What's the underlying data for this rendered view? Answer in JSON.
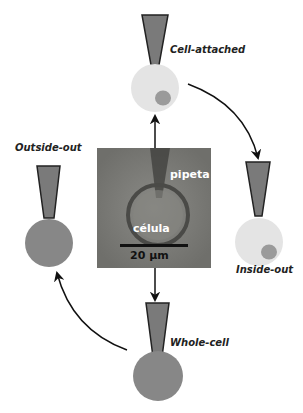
{
  "diagram": {
    "center_image": {
      "pipette_label": "pipeta",
      "cell_label": "célula",
      "scale_bar_label": "20 µm"
    },
    "configurations": [
      {
        "id": "cell-attached",
        "label": "Cell-attached",
        "cell_color": "#e4e4e4",
        "has_nucleus": true
      },
      {
        "id": "inside-out",
        "label": "Inside-out",
        "cell_color": "#e4e4e4",
        "has_nucleus": true
      },
      {
        "id": "whole-cell",
        "label": "Whole-cell",
        "cell_color": "#878787",
        "has_nucleus": false
      },
      {
        "id": "outside-out",
        "label": "Outside-out",
        "cell_color": "#878787",
        "has_nucleus": false
      }
    ],
    "colors": {
      "pipette_fill": "#7a7a7a",
      "pipette_edge": "#222222",
      "light_cell": "#e4e4e4",
      "nucleus": "#9a9a9a",
      "dark_cell": "#878787",
      "arrow": "#111111"
    }
  }
}
